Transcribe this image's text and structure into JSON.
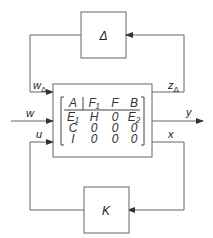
{
  "diagram": {
    "type": "lft-block-diagram",
    "blocks": {
      "uncertainty": {
        "label": "Δ"
      },
      "controller": {
        "label": "K"
      }
    },
    "signals": {
      "w_delta": {
        "label": "w",
        "sub": "Δ"
      },
      "z_delta": {
        "label": "z",
        "sub": "Δ"
      },
      "w": {
        "label": "w"
      },
      "y": {
        "label": "y"
      },
      "u": {
        "label": "u"
      },
      "x": {
        "label": "x"
      }
    },
    "matrix": {
      "rows": [
        [
          "A",
          "F₁",
          "F",
          "B"
        ],
        [
          "E₁",
          "H",
          "0",
          "E₂"
        ],
        [
          "C",
          "0",
          "0",
          "0"
        ],
        [
          "I",
          "0",
          "0",
          "0"
        ]
      ]
    },
    "colors": {
      "line": "#555555",
      "text": "#222222"
    }
  }
}
